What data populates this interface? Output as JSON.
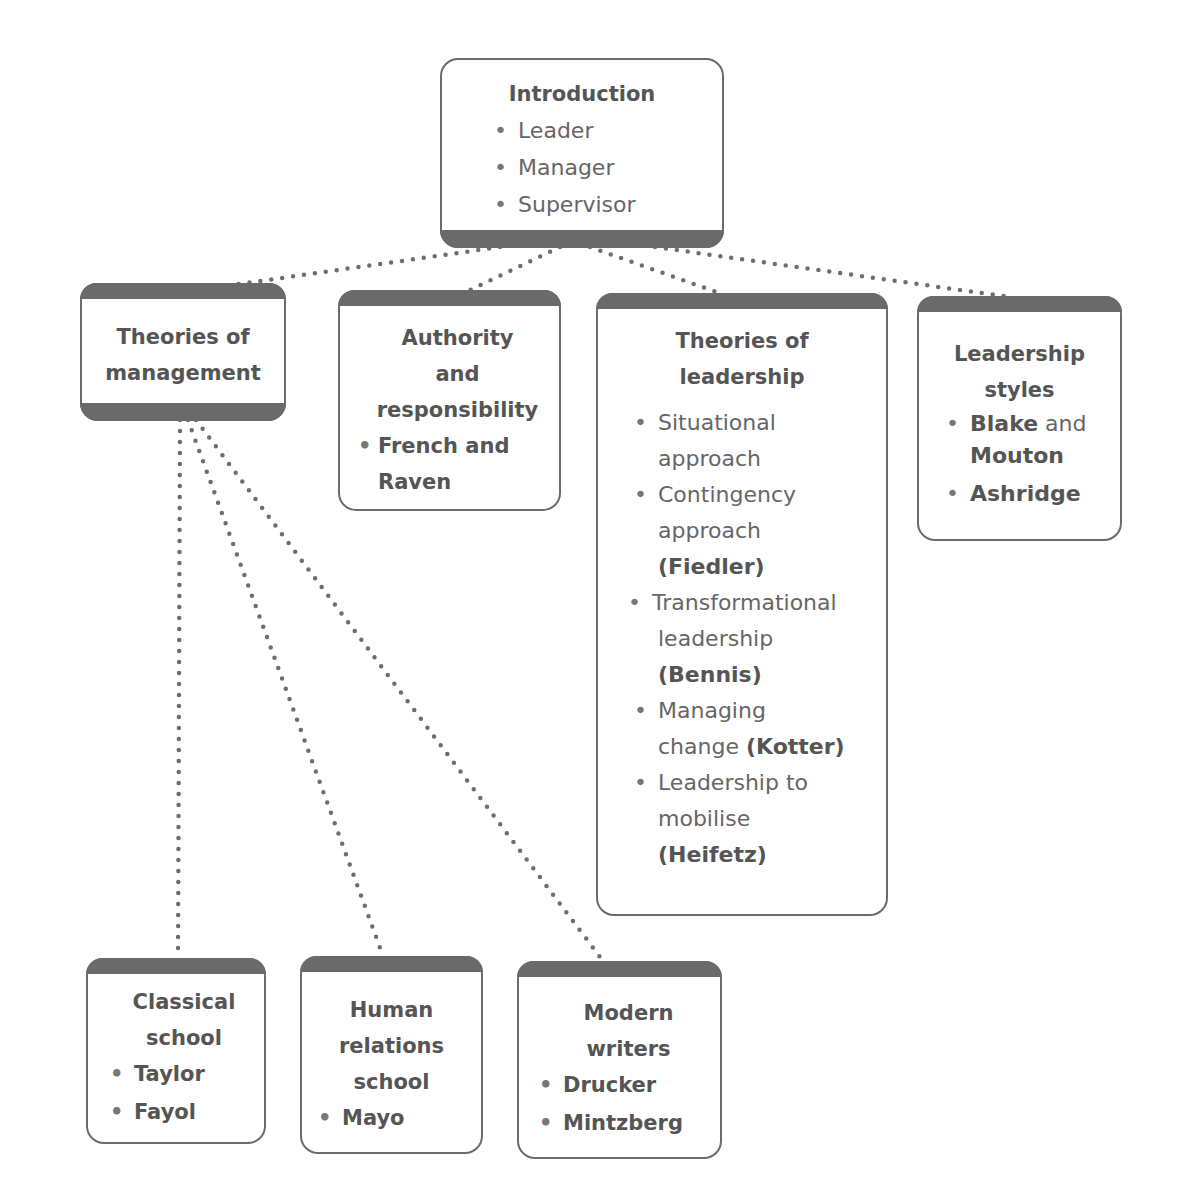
{
  "diagram": {
    "colors": {
      "box_border": "#6b6b6b",
      "band": "#6a6a6a",
      "connector": "#6e6e6e",
      "text": "#5a5a5a"
    },
    "introduction": {
      "title": "Introduction",
      "items": [
        "Leader",
        "Manager",
        "Supervisor"
      ]
    },
    "theories_of_management": {
      "title_line1": "Theories of",
      "title_line2": "management",
      "children": {
        "classical": {
          "title_line1": "Classical",
          "title_line2": "school",
          "items": [
            "Taylor",
            "Fayol"
          ]
        },
        "human_relations": {
          "title_line1": "Human",
          "title_line2": "relations",
          "title_line3": "school",
          "items": [
            "Mayo"
          ]
        },
        "modern_writers": {
          "title_line1": "Modern",
          "title_line2": "writers",
          "items": [
            "Drucker",
            "Mintzberg"
          ]
        }
      }
    },
    "authority": {
      "title_line1": "Authority",
      "title_line2": "and",
      "title_line3": "responsibility",
      "items": [
        {
          "line1": "French and",
          "line2": "Raven"
        }
      ]
    },
    "theories_of_leadership": {
      "title_line1": "Theories of",
      "title_line2": "leadership",
      "items": [
        {
          "line1": "Situational",
          "line2": "approach"
        },
        {
          "line1": "Contingency",
          "line2": "approach",
          "author": "(Fiedler)"
        },
        {
          "line1": "Transformational",
          "line2": "leadership",
          "author": "(Bennis)"
        },
        {
          "line1": "Managing",
          "line2": "change ",
          "author": "(Kotter)"
        },
        {
          "line1": "Leadership to",
          "line2": "mobilise",
          "author": "(Heifetz)"
        }
      ]
    },
    "leadership_styles": {
      "title_line1": "Leadership",
      "title_line2": "styles",
      "items": [
        {
          "bold": "Blake",
          "normal": " and",
          "line2": "Mouton"
        },
        {
          "bold": "Ashridge"
        }
      ]
    }
  }
}
